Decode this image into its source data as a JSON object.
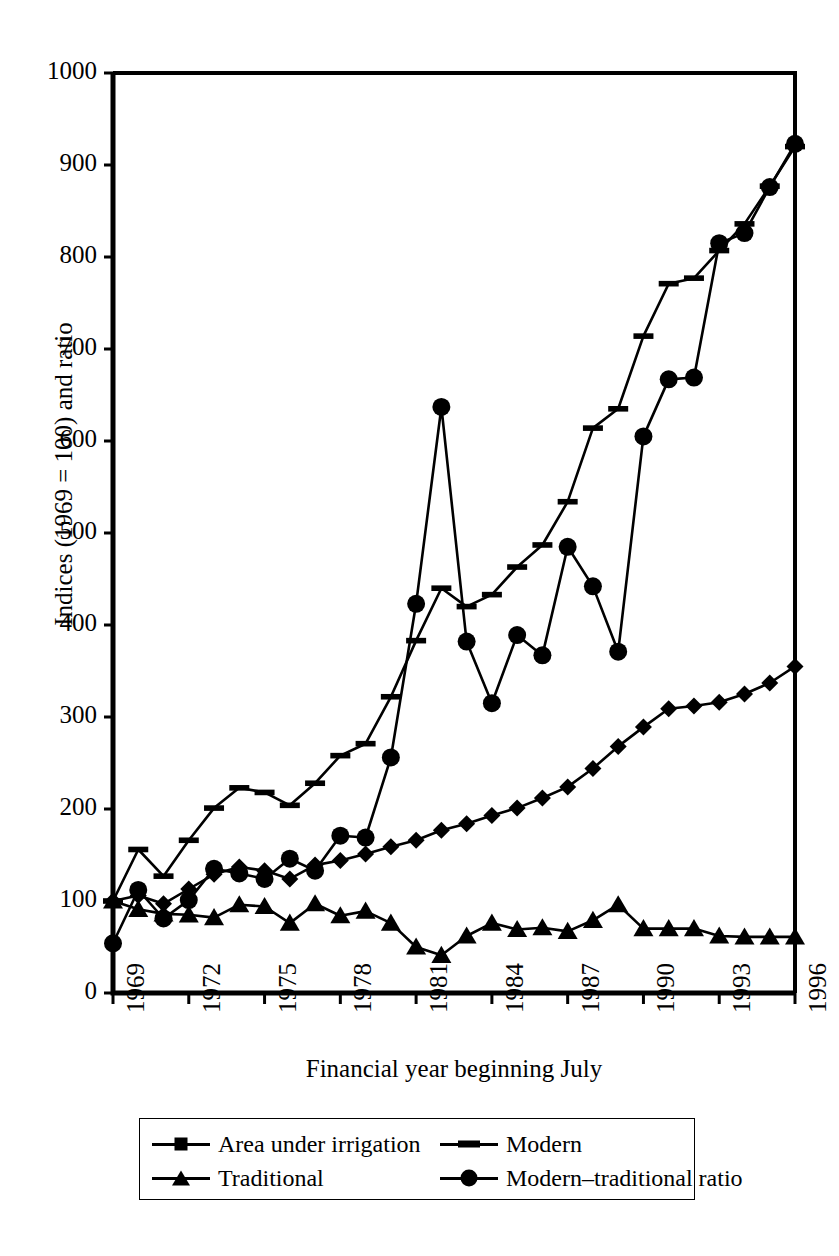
{
  "chart_data": {
    "type": "line",
    "title": "",
    "xlabel": "Financial year beginning July",
    "ylabel": "Indices (1969 = 100) and ratio",
    "xlim": [
      1969,
      1996
    ],
    "ylim": [
      0,
      1000
    ],
    "ytick_labels": [
      "0",
      "100",
      "200",
      "300",
      "400",
      "500",
      "600",
      "700",
      "800",
      "900",
      "1000"
    ],
    "ytick_values": [
      0,
      100,
      200,
      300,
      400,
      500,
      600,
      700,
      800,
      900,
      1000
    ],
    "xtick_labels": [
      "1969",
      "1972",
      "1975",
      "1978",
      "1981",
      "1984",
      "1987",
      "1990",
      "1993",
      "1996"
    ],
    "xtick_values": [
      1969,
      1972,
      1975,
      1978,
      1981,
      1984,
      1987,
      1990,
      1993,
      1996
    ],
    "grid": false,
    "legend_position": "below",
    "x": [
      1969,
      1970,
      1971,
      1972,
      1973,
      1974,
      1975,
      1976,
      1977,
      1978,
      1979,
      1980,
      1981,
      1982,
      1983,
      1984,
      1985,
      1986,
      1987,
      1988,
      1989,
      1990,
      1991,
      1992,
      1993,
      1994,
      1995,
      1996
    ],
    "series": [
      {
        "name": "Area under irrigation",
        "marker": "diamond",
        "values": [
          100,
          106,
          97,
          113,
          129,
          137,
          133,
          124,
          139,
          144,
          151,
          159,
          166,
          177,
          184,
          193,
          201,
          212,
          224,
          244,
          268,
          289,
          309,
          312,
          316,
          325,
          337,
          355
        ]
      },
      {
        "name": "Modern",
        "marker": "dash",
        "values": [
          100,
          156,
          127,
          166,
          201,
          223,
          218,
          204,
          228,
          258,
          271,
          322,
          383,
          440,
          420,
          433,
          463,
          487,
          534,
          614,
          635,
          714,
          771,
          777,
          807,
          836,
          877,
          920
        ]
      },
      {
        "name": "Traditional",
        "marker": "triangle",
        "values": [
          100,
          91,
          86,
          85,
          82,
          96,
          94,
          76,
          97,
          84,
          89,
          76,
          50,
          41,
          62,
          76,
          69,
          71,
          67,
          79,
          96,
          70,
          70,
          70,
          62,
          61,
          61,
          61
        ]
      },
      {
        "name": "Modern–traditional ratio",
        "marker": "circle",
        "values": [
          54,
          112,
          81,
          101,
          135,
          130,
          124,
          146,
          133,
          171,
          169,
          256,
          423,
          637,
          382,
          315,
          389,
          367,
          485,
          442,
          371,
          605,
          667,
          669,
          815,
          826,
          876,
          923
        ]
      }
    ]
  },
  "legend": {
    "items": [
      {
        "label": "Area under irrigation",
        "marker": "diamond"
      },
      {
        "label": "Modern",
        "marker": "dash"
      },
      {
        "label": "Traditional",
        "marker": "triangle"
      },
      {
        "label": "Modern–traditional ratio",
        "marker": "circle"
      }
    ]
  }
}
